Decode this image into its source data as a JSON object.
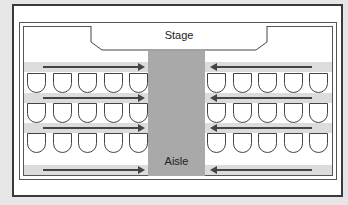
{
  "labels": {
    "stage": "Stage",
    "aisle": "Aisle"
  },
  "layout": {
    "sections": [
      "left",
      "right"
    ],
    "seat_rows_per_section": 3,
    "seats_per_row": 5,
    "walkways_per_section": 4,
    "left_arrow_direction": "right",
    "right_arrow_direction": "left"
  },
  "colors": {
    "background": "#e6e6e6",
    "frame": "#3a3a3a",
    "aisle": "#a9a9a9",
    "walkway": "#dcdcdc",
    "seat_fill": "#ffffff"
  }
}
